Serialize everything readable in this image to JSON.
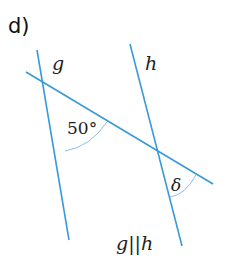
{
  "figure": {
    "part_label": "d)",
    "line_g_label": "g",
    "line_h_label": "h",
    "angle_given": "50°",
    "angle_unknown": "δ",
    "condition": "g||h",
    "line_color": "#3a9ad9"
  }
}
